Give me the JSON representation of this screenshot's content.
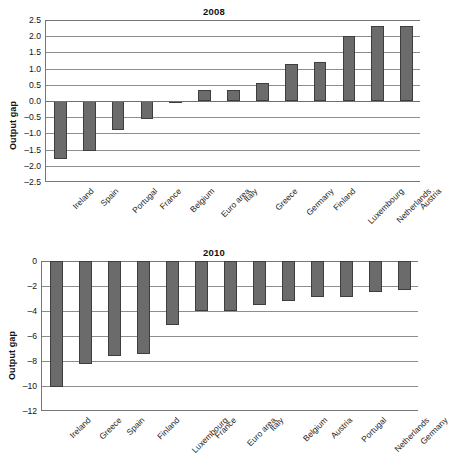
{
  "figure": {
    "ylabel": "Output gap",
    "bar_color": "#6b6b6b",
    "bar_edge_color": "#3e3e3e",
    "grid_color": "#8d8d8d",
    "axis_color": "#777777"
  },
  "chart_data": [
    {
      "type": "bar",
      "title": "2008",
      "xlabel": "",
      "ylabel": "Output gap",
      "ylim": [
        -2.5,
        2.5
      ],
      "yticks": [
        2.5,
        2.0,
        1.5,
        1.0,
        0.5,
        0.0,
        -0.5,
        -1.0,
        -1.5,
        -2.0,
        -2.5
      ],
      "ytick_labels": [
        "2.5",
        "2.0",
        "1.5",
        "1.0",
        "0.5",
        "0.0",
        "-0.5",
        "-1.0",
        "-1.5",
        "-2.0",
        "-2.5"
      ],
      "grid": true,
      "legend": "none",
      "categories": [
        "Ireland",
        "Spain",
        "Portugal",
        "France",
        "Belgium",
        "Euro area",
        "Italy",
        "Greece",
        "Germany",
        "Finland",
        "Luxembourg",
        "Netherlands",
        "Austria"
      ],
      "values": [
        -1.8,
        -1.55,
        -0.88,
        -0.55,
        -0.03,
        0.35,
        0.35,
        0.55,
        1.15,
        1.2,
        2.0,
        2.3,
        2.33
      ]
    },
    {
      "type": "bar",
      "title": "2010",
      "xlabel": "",
      "ylabel": "Output gap",
      "ylim": [
        -12,
        0
      ],
      "yticks": [
        0,
        -2,
        -4,
        -6,
        -8,
        -10,
        -12
      ],
      "ytick_labels": [
        "0",
        "-2",
        "-4",
        "-6",
        "-8",
        "-10",
        "-12"
      ],
      "grid": true,
      "legend": "none",
      "categories": [
        "Ireland",
        "Greece",
        "Spain",
        "Finland",
        "Luxembourg",
        "France",
        "Euro area",
        "Italy",
        "Belgium",
        "Austria",
        "Portugal",
        "Netherlands",
        "Germany"
      ],
      "values": [
        -10.1,
        -8.2,
        -7.6,
        -7.4,
        -5.1,
        -4.0,
        -4.0,
        -3.5,
        -3.2,
        -2.9,
        -2.85,
        -2.5,
        -2.3
      ]
    }
  ]
}
